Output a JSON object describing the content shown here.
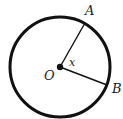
{
  "diagram": {
    "center_label": "O",
    "point_a_label": "A",
    "point_b_label": "B",
    "angle_label": "x",
    "colors": {
      "stroke": "#111111",
      "background": "#ffffff"
    }
  }
}
